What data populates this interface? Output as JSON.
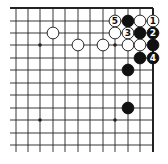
{
  "diagram": {
    "type": "go-board-corner",
    "corner": "top-right",
    "grid": {
      "x": [
        16,
        28,
        40,
        53,
        65,
        78,
        90,
        103,
        115,
        128,
        140,
        153
      ],
      "y": [
        8,
        21,
        33,
        45,
        58,
        70,
        83,
        95,
        108,
        120,
        133,
        145
      ],
      "x_min": 10,
      "y_max": 152,
      "edge_right": 153,
      "edge_top": 8
    },
    "colors": {
      "line": "#222222",
      "black": "#111111",
      "white": "#ffffff",
      "background": "#ffffff"
    },
    "star_points": [
      {
        "x": 40,
        "y": 45
      },
      {
        "x": 115,
        "y": 45
      },
      {
        "x": 40,
        "y": 120
      },
      {
        "x": 115,
        "y": 120
      }
    ],
    "stones": [
      {
        "color": "white",
        "x": 53,
        "y": 33,
        "label": ""
      },
      {
        "color": "white",
        "x": 78,
        "y": 45,
        "label": ""
      },
      {
        "color": "white",
        "x": 103,
        "y": 45,
        "label": ""
      },
      {
        "color": "white",
        "x": 115,
        "y": 21,
        "label": "5"
      },
      {
        "color": "black",
        "x": 128,
        "y": 21,
        "label": ""
      },
      {
        "color": "white",
        "x": 140,
        "y": 21,
        "label": ""
      },
      {
        "color": "white",
        "x": 153,
        "y": 21,
        "label": "1"
      },
      {
        "color": "white",
        "x": 115,
        "y": 33,
        "label": ""
      },
      {
        "color": "white",
        "x": 128,
        "y": 33,
        "label": "3"
      },
      {
        "color": "black",
        "x": 140,
        "y": 33,
        "label": ""
      },
      {
        "color": "black",
        "x": 153,
        "y": 33,
        "label": "2"
      },
      {
        "color": "white",
        "x": 128,
        "y": 45,
        "label": ""
      },
      {
        "color": "white",
        "x": 140,
        "y": 45,
        "label": ""
      },
      {
        "color": "black",
        "x": 153,
        "y": 45,
        "label": ""
      },
      {
        "color": "black",
        "x": 140,
        "y": 58,
        "label": ""
      },
      {
        "color": "black",
        "x": 153,
        "y": 58,
        "label": "4"
      },
      {
        "color": "black",
        "x": 128,
        "y": 70,
        "label": ""
      },
      {
        "color": "black",
        "x": 128,
        "y": 108,
        "label": ""
      }
    ]
  }
}
